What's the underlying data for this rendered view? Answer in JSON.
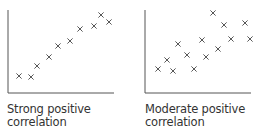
{
  "chart_data": [
    {
      "type": "scatter",
      "title": "Strong positive correlation",
      "caption_lines": [
        "Strong positive",
        "correlation"
      ],
      "xlabel": "",
      "ylabel": "",
      "grid": false,
      "marker": "x",
      "axes": {
        "x0": 8,
        "y0": 93,
        "x1": 114,
        "ytop": 10
      },
      "points": [
        [
          19,
          76
        ],
        [
          31,
          77
        ],
        [
          37,
          66
        ],
        [
          49,
          57
        ],
        [
          58,
          46
        ],
        [
          70,
          41
        ],
        [
          80,
          29
        ],
        [
          94,
          26
        ],
        [
          101,
          15
        ],
        [
          109,
          22
        ]
      ]
    },
    {
      "type": "scatter",
      "title": "Moderate positive correlation",
      "caption_lines": [
        "Moderate positive",
        "correlation"
      ],
      "xlabel": "",
      "ylabel": "",
      "grid": false,
      "marker": "x",
      "axes": {
        "x0": 145,
        "y0": 93,
        "x1": 251,
        "ytop": 10
      },
      "points": [
        [
          158,
          69
        ],
        [
          167,
          60
        ],
        [
          173,
          71
        ],
        [
          178,
          44
        ],
        [
          187,
          55
        ],
        [
          194,
          69
        ],
        [
          202,
          40
        ],
        [
          206,
          57
        ],
        [
          213,
          13
        ],
        [
          218,
          49
        ],
        [
          224,
          25
        ],
        [
          231,
          39
        ],
        [
          245,
          23
        ],
        [
          250,
          39
        ]
      ]
    }
  ],
  "colors": {
    "axis": "#555555",
    "marker": "#444444",
    "text": "#333333"
  }
}
